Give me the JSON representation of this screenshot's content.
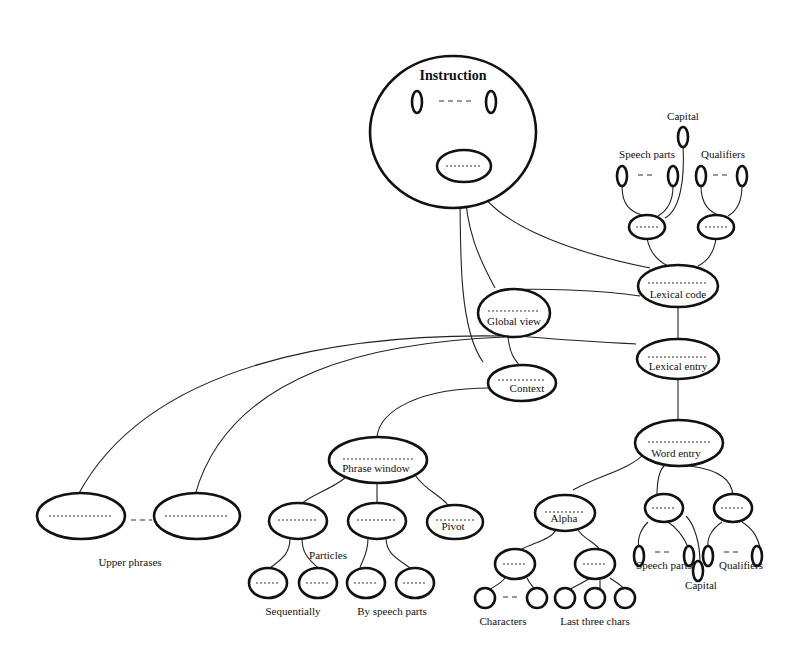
{
  "diagram": {
    "title": "Instruction",
    "labels": {
      "capital_top": "Capital",
      "speech_parts_top": "Speech parts",
      "qualifiers_top": "Qualifiers",
      "lexical_code": "Lexical code",
      "global_view": "Global view",
      "lexical_entry": "Lexical entry",
      "context": "Context",
      "word_entry": "Word entry",
      "phrase_window": "Phrase window",
      "pivot": "Pivot",
      "alpha": "Alpha",
      "particles": "Particles",
      "upper_phrases": "Upper phrases",
      "sequentially": "Sequentially",
      "by_speech_parts": "By speech parts",
      "characters": "Characters",
      "last_three_chars": "Last three chars",
      "speech_parts_bottom": "Speech parts",
      "qualifiers_bottom": "Qualifiers",
      "capital_bottom": "Capital"
    }
  }
}
